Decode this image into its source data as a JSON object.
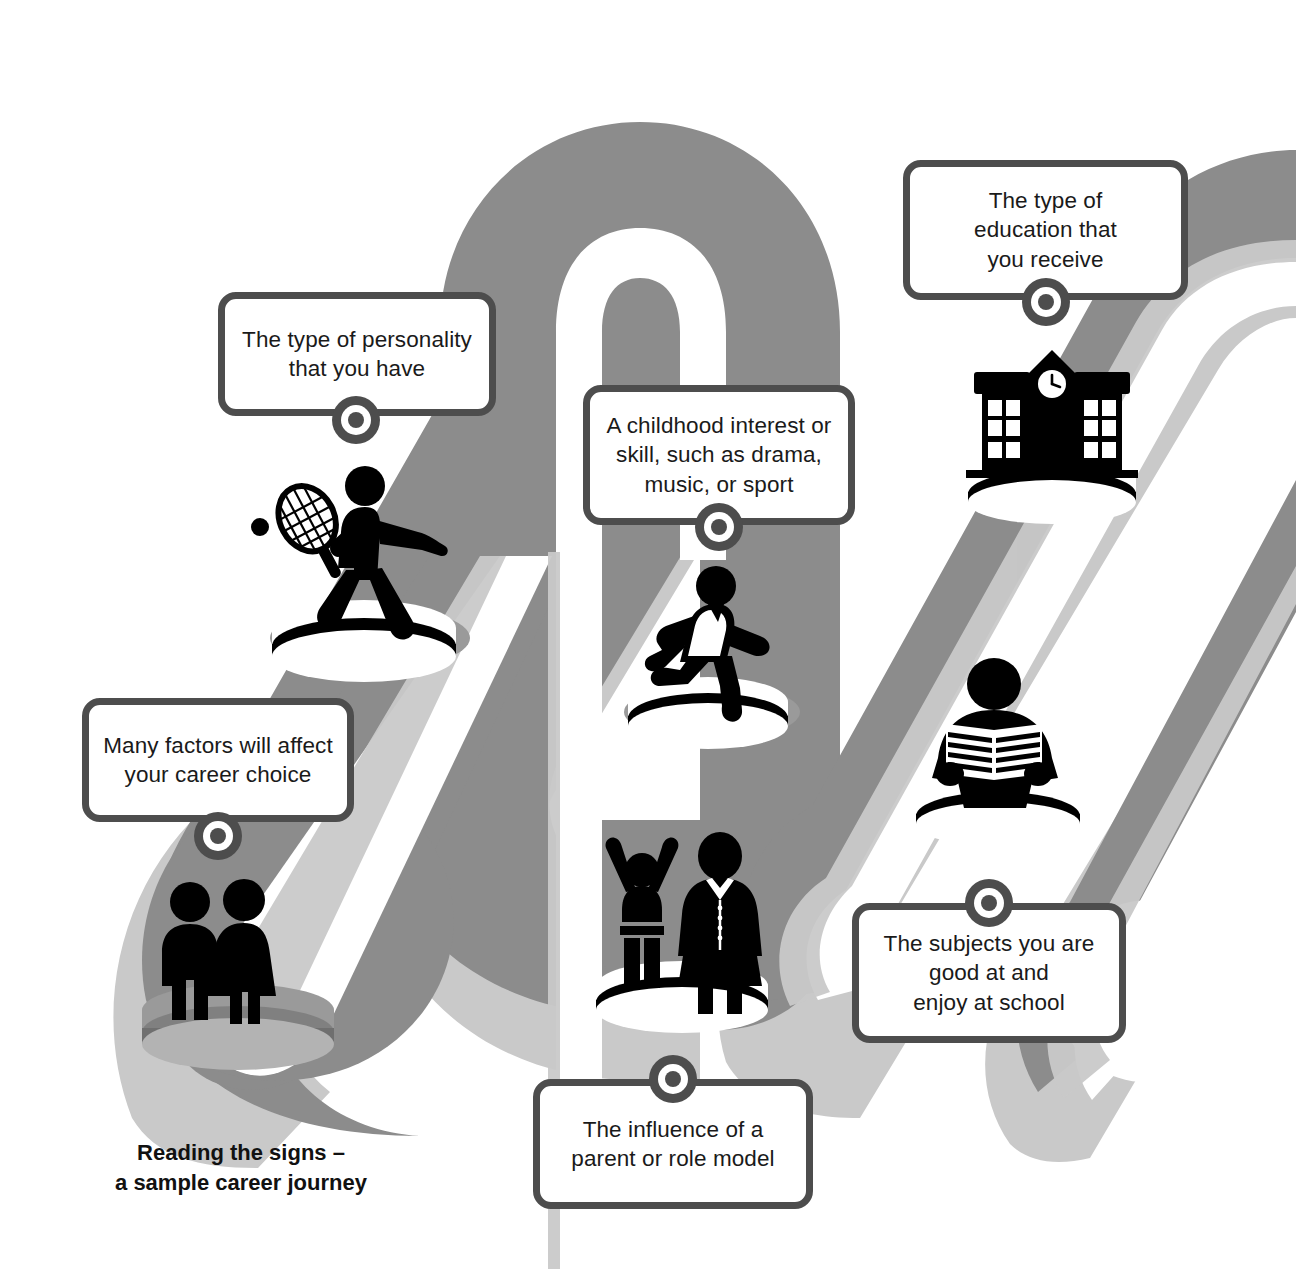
{
  "caption": {
    "text": "Reading the signs –\na sample career journey"
  },
  "colors": {
    "path_band": "#8c8c8c",
    "path_shadow": "#c9c9c9",
    "path_road": "#ffffff",
    "callout_border": "#4d4d4d",
    "callout_fill": "#ffffff",
    "marker": "#4d4d4d",
    "figure": "#000000",
    "background": "#ffffff",
    "text": "#1a1a1a"
  },
  "callouts": [
    {
      "id": "many-factors",
      "text": "Many factors will affect\nyour career choice",
      "marker_position": "bottom"
    },
    {
      "id": "personality",
      "text": "The type of personality\nthat you have",
      "marker_position": "bottom"
    },
    {
      "id": "childhood-interest",
      "text": "A childhood interest or\nskill, such as drama,\nmusic, or sport",
      "marker_position": "bottom"
    },
    {
      "id": "education",
      "text": "The type of\neducation that\nyou receive",
      "marker_position": "bottom"
    },
    {
      "id": "subjects",
      "text": "The subjects you are\ngood at and\nenjoy at school",
      "marker_position": "top"
    },
    {
      "id": "role-model",
      "text": "The influence of a\nparent or role model",
      "marker_position": "top"
    }
  ],
  "figures": [
    {
      "id": "couple",
      "icon": "couple-icon",
      "podium": "gray"
    },
    {
      "id": "tennis-player",
      "icon": "tennis-player-icon",
      "podium": "white"
    },
    {
      "id": "runner",
      "icon": "running-child-icon",
      "podium": "white"
    },
    {
      "id": "school-building",
      "icon": "school-building-icon",
      "podium": "white"
    },
    {
      "id": "reader",
      "icon": "person-reading-icon",
      "podium": "white"
    },
    {
      "id": "parent-child",
      "icon": "parent-and-child-icon",
      "podium": "white"
    }
  ]
}
